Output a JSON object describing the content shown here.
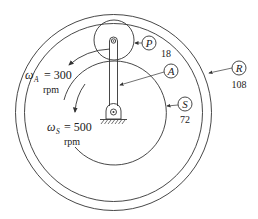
{
  "diagram": {
    "type": "planetary-gear-train",
    "colors": {
      "line": "#333333",
      "background": "#ffffff"
    },
    "components": {
      "planet": {
        "label": "P",
        "teeth": "18"
      },
      "arm": {
        "label": "A"
      },
      "sun": {
        "label": "S",
        "teeth": "72"
      },
      "ring": {
        "label": "R",
        "teeth": "108"
      }
    },
    "annotations": {
      "arm_speed": {
        "symbol": "ω",
        "subscript": "A",
        "value": "= 300",
        "unit": "rpm"
      },
      "sun_speed": {
        "symbol": "ω",
        "subscript": "S",
        "value": "= 500",
        "unit": "rpm"
      }
    }
  }
}
